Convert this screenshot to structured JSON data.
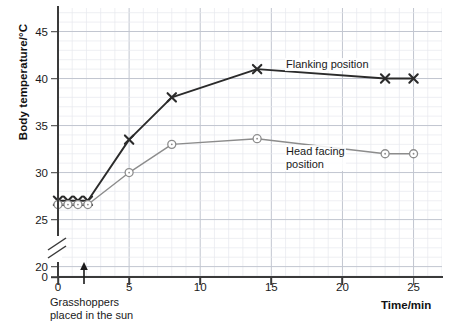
{
  "chart_data": {
    "type": "line",
    "title": "",
    "xlabel": "Time/min",
    "ylabel": "Body temperature/°C",
    "xlim": [
      0,
      27
    ],
    "ylim": [
      19,
      47.5
    ],
    "grid": true,
    "axis_break": {
      "present": true,
      "between": [
        0,
        20
      ],
      "label": "0"
    },
    "y_ticks": [
      20,
      25,
      30,
      35,
      40,
      45
    ],
    "y_tick_labels": [
      "20",
      "25",
      "30",
      "35",
      "40",
      "45"
    ],
    "y_zero_label": "0",
    "x_ticks": [
      0,
      5,
      10,
      15,
      20,
      25
    ],
    "x_tick_labels": [
      "0",
      "5",
      "10",
      "15",
      "20",
      "25"
    ],
    "legend_position": "inline-annotations",
    "annotations": [
      {
        "name": "grasshoppers-placed-in-sun",
        "text_line1": "Grasshoppers",
        "text_line2": "placed in the sun",
        "x": 2,
        "arrow": "up"
      }
    ],
    "series": [
      {
        "name": "Flanking position",
        "marker": "x",
        "color": "#2b2b2b",
        "x": [
          0,
          0.7,
          1.4,
          2.1,
          5,
          8,
          14,
          23,
          25
        ],
        "values": [
          27,
          27,
          27,
          27,
          33.5,
          38,
          41,
          40,
          40
        ]
      },
      {
        "name": "Head facing position",
        "marker": "circle",
        "color": "#8c8c8c",
        "x": [
          0,
          0.7,
          1.4,
          2.1,
          5,
          8,
          14,
          23,
          25
        ],
        "values": [
          26.6,
          26.6,
          26.6,
          26.6,
          30,
          33,
          33.6,
          32,
          32
        ]
      }
    ]
  },
  "labels": {
    "flanking": "Flanking position",
    "head_facing_line1": "Head facing",
    "head_facing_line2": "position"
  },
  "colors": {
    "flanking": "#2b2b2b",
    "head_facing": "#8c8c8c",
    "axis": "#3a3a3a",
    "grid_minor": "#e6e8ee",
    "grid_major": "#c2c6d0",
    "background": "#ffffff"
  }
}
